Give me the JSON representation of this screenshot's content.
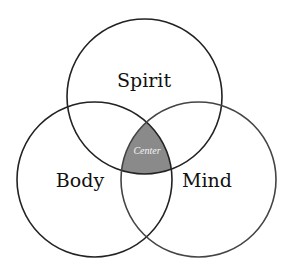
{
  "diagram": {
    "type": "venn",
    "colors": {
      "background": "#ffffff",
      "stroke": "#222222",
      "center_fill": "#8a8a8a",
      "center_text": "#f4f4f4"
    },
    "sets": [
      {
        "id": "spirit",
        "label": "Spirit"
      },
      {
        "id": "body",
        "label": "Body"
      },
      {
        "id": "mind",
        "label": "Mind"
      }
    ],
    "intersection": {
      "sets": [
        "spirit",
        "body",
        "mind"
      ],
      "label": "Center"
    }
  }
}
